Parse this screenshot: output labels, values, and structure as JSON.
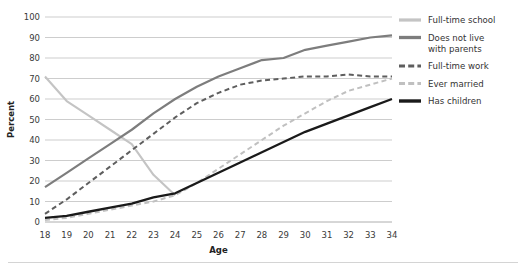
{
  "chart_data": {
    "type": "line",
    "title": "",
    "xlabel": "Age",
    "ylabel": "Percent",
    "xlim": [
      18,
      34
    ],
    "ylim": [
      0,
      100
    ],
    "ytick_step": 10,
    "grid": true,
    "legend_position": "right",
    "x": [
      18,
      19,
      20,
      21,
      22,
      23,
      24,
      25,
      26,
      27,
      28,
      29,
      30,
      31,
      32,
      33,
      34
    ],
    "xtick_labels": [
      "18",
      "19",
      "20",
      "21",
      "22",
      "23",
      "24",
      "25",
      "26",
      "27",
      "28",
      "29",
      "30",
      "31",
      "32",
      "33",
      "34"
    ],
    "ytick_labels": [
      "0",
      "10",
      "20",
      "30",
      "40",
      "50",
      "60",
      "70",
      "80",
      "90",
      "100"
    ],
    "series": [
      {
        "name": "Full-time school",
        "color": "#c4c4c4",
        "style": "solid",
        "width": 2.1,
        "values": [
          71,
          59,
          52,
          45,
          38,
          23,
          13,
          null,
          null,
          null,
          null,
          null,
          null,
          null,
          null,
          null,
          null
        ]
      },
      {
        "name": "Does not live with parents",
        "color": "#7d7d7d",
        "style": "solid",
        "width": 2.2,
        "values": [
          17,
          24,
          31,
          38,
          45,
          53,
          60,
          66,
          71,
          75,
          79,
          80,
          84,
          86,
          88,
          90,
          91
        ]
      },
      {
        "name": "Full-time work",
        "color": "#5e5e5e",
        "style": "dashed",
        "width": 2.0,
        "values": [
          4,
          11,
          19,
          27,
          35,
          43,
          51,
          58,
          63,
          67,
          69,
          70,
          71,
          71,
          72,
          71,
          71
        ]
      },
      {
        "name": "Ever married",
        "color": "#c0c0c0",
        "style": "dashed",
        "width": 2.0,
        "values": [
          1,
          2,
          4,
          6,
          8,
          10,
          13,
          19,
          26,
          33,
          40,
          47,
          53,
          59,
          64,
          67,
          70
        ]
      },
      {
        "name": "Has children",
        "color": "#1a1a1a",
        "style": "solid",
        "width": 2.3,
        "values": [
          2,
          3,
          5,
          7,
          9,
          12,
          14,
          19,
          24,
          29,
          34,
          39,
          44,
          48,
          52,
          56,
          60
        ]
      }
    ]
  },
  "legend": {
    "items": [
      {
        "label": "Full-time school"
      },
      {
        "label": "Does not live\nwith parents"
      },
      {
        "label": "Full-time work"
      },
      {
        "label": "Ever married"
      },
      {
        "label": "Has children"
      }
    ]
  }
}
